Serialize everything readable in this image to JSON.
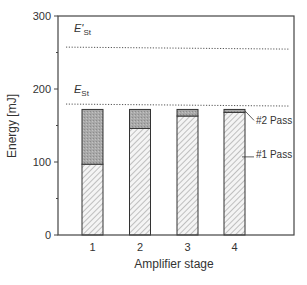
{
  "chart_data": {
    "type": "bar",
    "stacked": true,
    "title": "",
    "xlabel": "Amplifier stage",
    "ylabel": "Energy [mJ]",
    "ylim": [
      0,
      300
    ],
    "yticks": [
      0,
      100,
      200,
      300
    ],
    "categories": [
      "1",
      "2",
      "3",
      "4"
    ],
    "series": [
      {
        "name": "#1 Pass",
        "values": [
          97,
          146,
          163,
          168
        ],
        "pattern": "hatched"
      },
      {
        "name": "#2 Pass",
        "values": [
          75,
          26,
          9,
          4
        ],
        "pattern": "stippled-gray"
      }
    ],
    "totals": [
      172,
      172,
      172,
      172
    ],
    "reference_lines": [
      {
        "label": "E'St",
        "label_main": "E'",
        "label_sub": "St",
        "value": 256,
        "style": "dotted"
      },
      {
        "label": "ESt",
        "label_main": "E",
        "label_sub": "St",
        "value": 178,
        "style": "dotted"
      }
    ],
    "annotations": [
      "#2 Pass",
      "#1 Pass"
    ],
    "grid": false,
    "legend": "inline annotations on right of stage 4 bar"
  },
  "labels": {
    "xlabel": "Amplifier stage",
    "ylabel": "Energy [mJ]",
    "pass2": "#2 Pass",
    "pass1": "#1 Pass",
    "ref_hi_main": "E'",
    "ref_hi_sub": "St",
    "ref_lo_main": "E",
    "ref_lo_sub": "St"
  }
}
